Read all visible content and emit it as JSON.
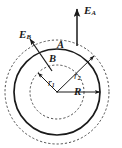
{
  "figure": {
    "background_color": "#ffffff",
    "stroke_color": "#1a1a1a",
    "center": {
      "x": 57,
      "y": 92
    }
  },
  "labels": {
    "field_outer": {
      "symbol": "E",
      "subscript": "A",
      "x": 84,
      "y": 5
    },
    "field_inner": {
      "symbol": "E",
      "subscript": "B",
      "x": 19,
      "y": 29
    },
    "point_outer": {
      "text": "A",
      "x": 57,
      "y": 40
    },
    "point_inner": {
      "text": "B",
      "x": 49,
      "y": 54
    },
    "radius_inner": {
      "symbol": "r",
      "subscript": "1",
      "x": 48,
      "y": 79
    },
    "radius_outer": {
      "symbol": "r",
      "subscript": "2",
      "x": 74,
      "y": 72
    },
    "radius_sphere": {
      "symbol": "R",
      "subscript": "",
      "x": 74,
      "y": 86
    }
  },
  "circles": [
    {
      "name": "inner-dashed-circle",
      "radius": 27,
      "style": "dashed",
      "label": "r1"
    },
    {
      "name": "solid-circle",
      "radius": 43,
      "style": "solid",
      "label": "R"
    },
    {
      "name": "outer-dashed-circle",
      "radius": 52,
      "style": "dashed",
      "label": "r2"
    }
  ],
  "vectors": [
    {
      "name": "E_A",
      "from_point": "A",
      "direction": "radially-outward-up"
    },
    {
      "name": "E_B",
      "from_point": "B",
      "direction": "radially-outward-up-left"
    },
    {
      "name": "r1",
      "direction": "up-left",
      "to": "inner-dashed-circle"
    },
    {
      "name": "r2",
      "direction": "up-right",
      "to": "outer-dashed-circle"
    },
    {
      "name": "R",
      "direction": "right",
      "to": "solid-circle"
    }
  ]
}
